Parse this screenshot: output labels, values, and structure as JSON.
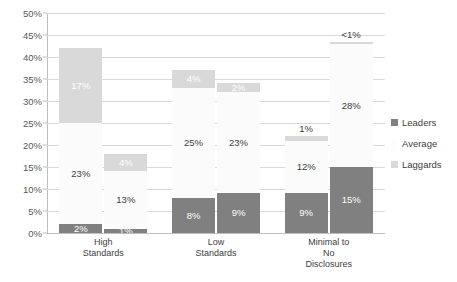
{
  "chart_data": {
    "type": "bar",
    "subtype": "stacked-column-grouped",
    "title": "",
    "subtitle": "",
    "xlabel": "",
    "ylabel": "",
    "ylim": [
      0,
      50
    ],
    "yunit": "%",
    "grid": true,
    "legend_position": "right",
    "categories": [
      "High Standards",
      "Low Standards",
      "Minimal to No Disclosures"
    ],
    "category_lines": [
      [
        "High",
        "Standards"
      ],
      [
        "Low",
        "Standards"
      ],
      [
        "Minimal to",
        "No",
        "Disclosures"
      ]
    ],
    "ytick_labels": [
      "0%",
      "5%",
      "10%",
      "15%",
      "20%",
      "25%",
      "30%",
      "35%",
      "40%",
      "45%",
      "50%"
    ],
    "ytick_values": [
      0,
      5,
      10,
      15,
      20,
      25,
      30,
      35,
      40,
      45,
      50
    ],
    "series": [
      {
        "name": "Leaders",
        "color": "#808080"
      },
      {
        "name": "Average",
        "color": "#fbfbfb"
      },
      {
        "name": "Laggards",
        "color": "#d9d9d9"
      }
    ],
    "bars": [
      {
        "category": "High Standards",
        "bar_index": 0,
        "total": 42,
        "segments": [
          {
            "series": "Leaders",
            "value": 2,
            "label": "2%",
            "label_placement": "inside"
          },
          {
            "series": "Average",
            "value": 23,
            "label": "23%",
            "label_placement": "inside"
          },
          {
            "series": "Laggards",
            "value": 17,
            "label": "17%",
            "label_placement": "inside"
          }
        ]
      },
      {
        "category": "High Standards",
        "bar_index": 1,
        "total": 18,
        "segments": [
          {
            "series": "Leaders",
            "value": 1,
            "label": "1%",
            "label_placement": "inside"
          },
          {
            "series": "Average",
            "value": 13,
            "label": "13%",
            "label_placement": "inside"
          },
          {
            "series": "Laggards",
            "value": 4,
            "label": "4%",
            "label_placement": "inside"
          }
        ]
      },
      {
        "category": "Low Standards",
        "bar_index": 0,
        "total": 37,
        "segments": [
          {
            "series": "Leaders",
            "value": 8,
            "label": "8%",
            "label_placement": "inside"
          },
          {
            "series": "Average",
            "value": 25,
            "label": "25%",
            "label_placement": "inside"
          },
          {
            "series": "Laggards",
            "value": 4,
            "label": "4%",
            "label_placement": "inside"
          }
        ]
      },
      {
        "category": "Low Standards",
        "bar_index": 1,
        "total": 34,
        "segments": [
          {
            "series": "Leaders",
            "value": 9,
            "label": "9%",
            "label_placement": "inside"
          },
          {
            "series": "Average",
            "value": 23,
            "label": "23%",
            "label_placement": "inside"
          },
          {
            "series": "Laggards",
            "value": 2,
            "label": "2%",
            "label_placement": "inside"
          }
        ]
      },
      {
        "category": "Minimal to No Disclosures",
        "bar_index": 0,
        "total": 22,
        "segments": [
          {
            "series": "Leaders",
            "value": 9,
            "label": "9%",
            "label_placement": "inside"
          },
          {
            "series": "Average",
            "value": 12,
            "label": "12%",
            "label_placement": "inside"
          },
          {
            "series": "Laggards",
            "value": 1,
            "label": "1%",
            "label_placement": "above"
          }
        ]
      },
      {
        "category": "Minimal to No Disclosures",
        "bar_index": 1,
        "total": 43,
        "segments": [
          {
            "series": "Leaders",
            "value": 15,
            "label": "15%",
            "label_placement": "inside"
          },
          {
            "series": "Average",
            "value": 28,
            "label": "28%",
            "label_placement": "inside"
          },
          {
            "series": "Laggards",
            "value": 0.4,
            "label": "<1%",
            "label_placement": "above"
          }
        ]
      }
    ]
  },
  "legend": {
    "items": [
      {
        "label": "Leaders",
        "color": "#808080",
        "has_swatch": true
      },
      {
        "label": "Average",
        "color": "#fdfdfd",
        "has_swatch": true
      },
      {
        "label": "Laggards",
        "color": "#d9d9d9",
        "has_swatch": true
      }
    ]
  },
  "colors": {
    "leaders": "#808080",
    "average": "#fbfbfb",
    "laggards": "#d9d9d9",
    "gridline": "#d9d9d9",
    "axis": "#bfbfbf",
    "tick_text": "#595959",
    "label_text": "#404040",
    "background": "#ffffff"
  }
}
